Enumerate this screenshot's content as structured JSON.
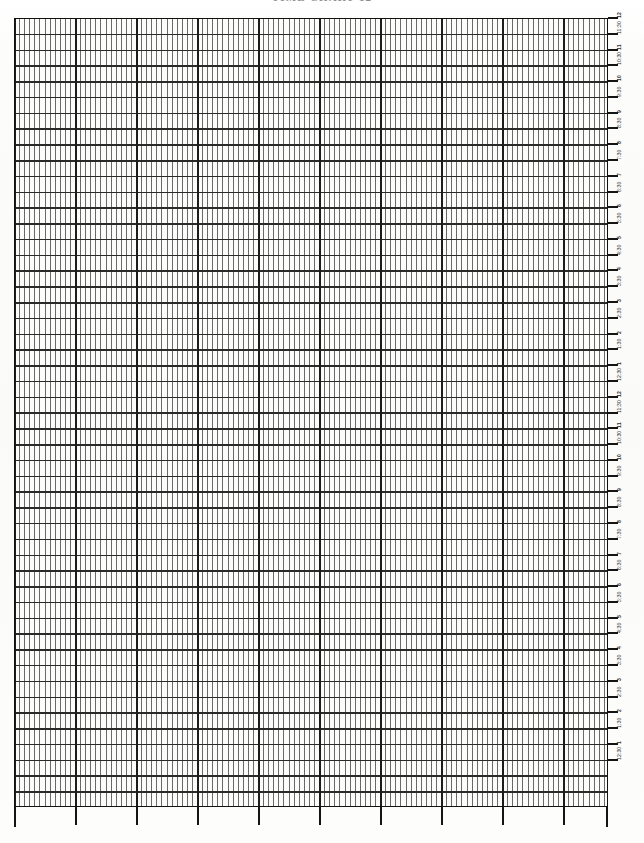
{
  "document": {
    "title_cropped": "TIME CHART 12",
    "kind": "time-grid-chart"
  },
  "chart_data": {
    "type": "table",
    "title": "TIME CHART 12",
    "xlabel": "",
    "ylabel": "",
    "grid": true,
    "legend": null,
    "y_axis": {
      "orientation": "right",
      "direction": "top-to-bottom",
      "tick_count": 50,
      "major_interval": "1 hour",
      "minor_interval": "30 minutes",
      "label_rotation_deg": -90,
      "ticks": [
        {
          "label": "12",
          "hour": true
        },
        {
          "label": "11:30",
          "hour": false
        },
        {
          "label": "11",
          "hour": true
        },
        {
          "label": "10:30",
          "hour": false
        },
        {
          "label": "10",
          "hour": true
        },
        {
          "label": "9:30",
          "hour": false
        },
        {
          "label": "9",
          "hour": true
        },
        {
          "label": "8:30",
          "hour": false
        },
        {
          "label": "8",
          "hour": true
        },
        {
          "label": "7:30",
          "hour": false
        },
        {
          "label": "7",
          "hour": true
        },
        {
          "label": "6:30",
          "hour": false
        },
        {
          "label": "6",
          "hour": true
        },
        {
          "label": "5:30",
          "hour": false
        },
        {
          "label": "5",
          "hour": true
        },
        {
          "label": "4:30",
          "hour": false
        },
        {
          "label": "4",
          "hour": true
        },
        {
          "label": "3:30",
          "hour": false
        },
        {
          "label": "3",
          "hour": true
        },
        {
          "label": "2:30",
          "hour": false
        },
        {
          "label": "2",
          "hour": true
        },
        {
          "label": "1:30",
          "hour": false
        },
        {
          "label": "1",
          "hour": true
        },
        {
          "label": "12:30",
          "hour": false
        },
        {
          "label": "12",
          "hour": true
        },
        {
          "label": "11:30",
          "hour": false
        },
        {
          "label": "11",
          "hour": true
        },
        {
          "label": "10:30",
          "hour": false
        },
        {
          "label": "10",
          "hour": true
        },
        {
          "label": "9:30",
          "hour": false
        },
        {
          "label": "9",
          "hour": true
        },
        {
          "label": "8:30",
          "hour": false
        },
        {
          "label": "8",
          "hour": true
        },
        {
          "label": "7:30",
          "hour": false
        },
        {
          "label": "7",
          "hour": true
        },
        {
          "label": "6:30",
          "hour": false
        },
        {
          "label": "6",
          "hour": true
        },
        {
          "label": "5:30",
          "hour": false
        },
        {
          "label": "5",
          "hour": true
        },
        {
          "label": "4:30",
          "hour": false
        },
        {
          "label": "4",
          "hour": true
        },
        {
          "label": "3:30",
          "hour": false
        },
        {
          "label": "3",
          "hour": true
        },
        {
          "label": "2:30",
          "hour": false
        },
        {
          "label": "2",
          "hour": true
        },
        {
          "label": "1:30",
          "hour": false
        },
        {
          "label": "1",
          "hour": true
        },
        {
          "label": "12:30",
          "hour": false
        }
      ]
    },
    "x_axis": {
      "orientation": "bottom",
      "major_divisions": 10,
      "minor_per_major": 12,
      "tick_labels": [],
      "labelled": false
    },
    "series": []
  },
  "grid_geometry": {
    "plot_left": 14,
    "plot_top": 18,
    "plot_width": 594,
    "plot_height": 789,
    "minor_v_spacing": 5.0847,
    "major_v_spacing": 61.0166,
    "h_spacing": 15.78,
    "row_count": 50,
    "major_col_count": 10
  },
  "colors": {
    "paper": "#fbfbfa",
    "minor_rule": "#6a6a6a",
    "major_rule": "#1c1c1c",
    "horizontal_rule": "#2a2a2a",
    "border": "#111111",
    "label_text": "#2d2d2d"
  }
}
